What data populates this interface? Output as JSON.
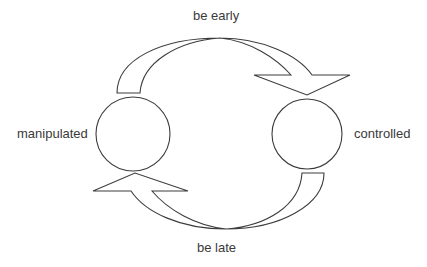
{
  "diagram": {
    "colors": {
      "stroke": "#3c3c3c",
      "fill": "#ffffff",
      "text": "#3a3a3a"
    },
    "nodes": [
      {
        "id": "left",
        "label": "manipulated"
      },
      {
        "id": "right",
        "label": "controlled"
      }
    ],
    "edges": [
      {
        "from": "left",
        "to": "right",
        "label": "be early",
        "position": "top"
      },
      {
        "from": "right",
        "to": "left",
        "label": "be late",
        "position": "bottom"
      }
    ]
  }
}
